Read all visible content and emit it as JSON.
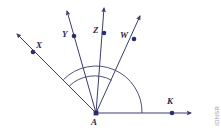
{
  "figure": {
    "type": "geometry-diagram",
    "stroke_color": "#3c3c6e",
    "label_color": "#2b2b4a",
    "background_color": "#ffffff",
    "watermark": "IDNSR"
  },
  "vertex": {
    "name": "A",
    "label": "A",
    "x": 96,
    "y": 113
  },
  "rays": [
    {
      "id": "ray-ax",
      "label": "X",
      "label_x": 36,
      "label_y": 43,
      "dot_x": 33,
      "dot_y": 52,
      "tip_x": 14,
      "tip_y": 31,
      "direction_deg": 138
    },
    {
      "id": "ray-ay",
      "label": "Y",
      "label_x": 62,
      "label_y": 32,
      "dot_x": 74,
      "dot_y": 36,
      "tip_x": 66,
      "tip_y": 7,
      "direction_deg": 105
    },
    {
      "id": "ray-az",
      "label": "Z",
      "label_x": 94,
      "label_y": 28,
      "dot_x": 104,
      "dot_y": 33,
      "tip_x": 104,
      "tip_y": 4,
      "direction_deg": 92
    },
    {
      "id": "ray-aw",
      "label": "W",
      "label_x": 121,
      "label_y": 33,
      "dot_x": 134,
      "dot_y": 39,
      "tip_x": 143,
      "tip_y": 12,
      "direction_deg": 63
    },
    {
      "id": "ray-ak",
      "label": "K",
      "label_x": 168,
      "label_y": 99,
      "dot_x": 172,
      "dot_y": 113,
      "tip_x": 195,
      "tip_y": 113,
      "direction_deg": 0
    }
  ],
  "arcs": [
    {
      "id": "arc-inner",
      "from_ray": "ray-ax",
      "to_ray": "ray-aw",
      "radius": 36
    },
    {
      "id": "arc-outer",
      "from_ray": "ray-ax",
      "to_ray": "ray-ak",
      "radius": 46
    }
  ]
}
